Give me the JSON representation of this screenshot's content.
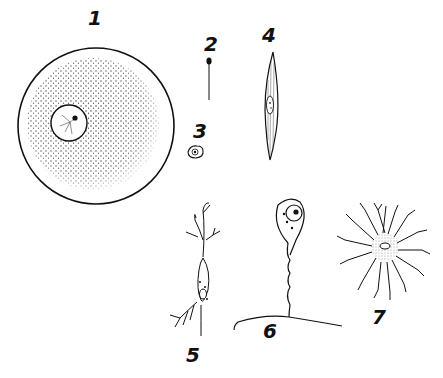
{
  "figure": {
    "ink_color": "#111111",
    "background": "#ffffff",
    "labels": [
      {
        "id": "1",
        "text": "1",
        "x": 88,
        "y": 8
      },
      {
        "id": "2",
        "text": "2",
        "x": 204,
        "y": 34
      },
      {
        "id": "3",
        "text": "3",
        "x": 193,
        "y": 121
      },
      {
        "id": "4",
        "text": "4",
        "x": 262,
        "y": 25
      },
      {
        "id": "5",
        "text": "5",
        "x": 186,
        "y": 345
      },
      {
        "id": "6",
        "text": "6",
        "x": 263,
        "y": 321
      },
      {
        "id": "7",
        "text": "7",
        "x": 372,
        "y": 307
      }
    ]
  }
}
